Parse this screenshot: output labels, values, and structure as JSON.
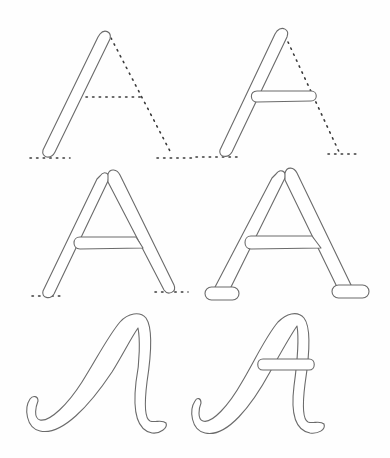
{
  "figure": {
    "subject": "Step-by-step construction of the letter A",
    "letter": "A",
    "colors": {
      "background": "#fefefe",
      "outline": "#6b6b6b",
      "guide_dots": "#3a3a3a",
      "fill": "#ffffff"
    },
    "panels": [
      {
        "id": 1,
        "label": "Step 1: left diagonal stroke with dotted guides for right stroke, crossbar and baseline"
      },
      {
        "id": 2,
        "label": "Step 2: left stroke plus crossbar, dotted guide for right stroke and baseline"
      },
      {
        "id": 3,
        "label": "Step 3: both diagonal strokes and crossbar, dotted baseline"
      },
      {
        "id": 4,
        "label": "Step 4: block A with serif feet"
      },
      {
        "id": 5,
        "label": "Step 5: cursive A body stroke"
      },
      {
        "id": 6,
        "label": "Step 6: cursive A with crossbar"
      }
    ]
  }
}
